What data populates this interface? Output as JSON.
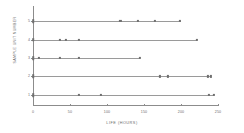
{
  "chart_data": {
    "type": "scatter",
    "title": "",
    "xlabel": "LIFE (HOURS)",
    "ylabel": "SAMPLE UNIT NUMBER",
    "xlim": [
      0,
      250
    ],
    "ylim": [
      0.4,
      5.6
    ],
    "grid": false,
    "legend": null,
    "xticks": [
      0,
      50,
      100,
      150,
      200,
      250
    ],
    "xticklabels": [
      "0",
      "50",
      "100",
      "150",
      "200",
      "250"
    ],
    "yticks": [
      1,
      2,
      3,
      4,
      5
    ],
    "yticklabels": [
      "1",
      "2",
      "3",
      "4",
      "5"
    ],
    "series": [
      {
        "name": "5",
        "unit": 5,
        "line_start": 0,
        "line_end": 200,
        "x": [
          0,
          118,
          142,
          165,
          198
        ],
        "markers": [
          "start",
          "point",
          "point",
          "point",
          "point"
        ]
      },
      {
        "name": "4",
        "unit": 4,
        "line_start": 0,
        "line_end": 222,
        "x": [
          0,
          36,
          44,
          62,
          222
        ],
        "markers": [
          "start",
          "point",
          "point",
          "point",
          "point"
        ]
      },
      {
        "name": "3",
        "unit": 3,
        "line_start": 0,
        "line_end": 145,
        "x": [
          0,
          8,
          36,
          62,
          145
        ],
        "markers": [
          "start",
          "point",
          "point",
          "point",
          "point"
        ]
      },
      {
        "name": "2",
        "unit": 2,
        "line_start": 0,
        "line_end": 240,
        "x": [
          0,
          172,
          182,
          236,
          240
        ],
        "markers": [
          "start",
          "point",
          "point",
          "point",
          "point"
        ]
      },
      {
        "name": "1",
        "unit": 1,
        "line_start": 0,
        "line_end": 244,
        "x": [
          0,
          62,
          92,
          238,
          244
        ],
        "markers": [
          "start",
          "point",
          "point",
          "point",
          "point"
        ]
      }
    ]
  }
}
